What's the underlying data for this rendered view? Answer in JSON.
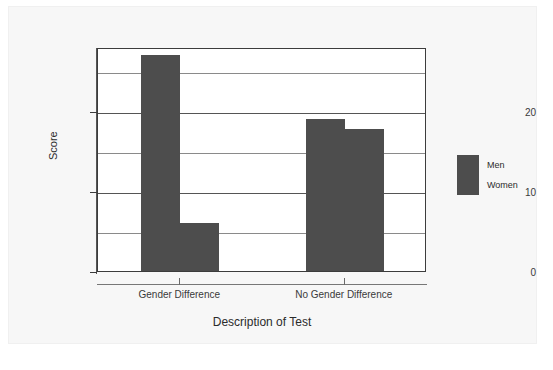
{
  "chart_data": {
    "type": "bar",
    "title": "",
    "xlabel": "Description of Test",
    "ylabel": "Score",
    "categories": [
      "Gender Difference",
      "No Gender Difference"
    ],
    "series": [
      {
        "name": "Men",
        "values": [
          27,
          19
        ],
        "color": "#4d4d4d"
      },
      {
        "name": "Women",
        "values": [
          6,
          17.8
        ],
        "color": "#4d4d4d"
      }
    ],
    "ylim": [
      0,
      28
    ],
    "ytick_labels": [
      "0",
      "10",
      "20"
    ],
    "ytick_values": [
      0,
      10,
      20
    ],
    "gridline_values": [
      5,
      10,
      15,
      20,
      25
    ],
    "grid": true,
    "legend_position": "right",
    "legend_entries": [
      "Men",
      "Women"
    ],
    "background_color": "#f7f7f7",
    "plot_background_color": "#ffffff",
    "axis_color": "#3c3c3c"
  }
}
